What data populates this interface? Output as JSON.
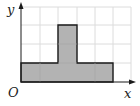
{
  "diagram": {
    "type": "region-on-grid",
    "axes": {
      "x_label": "x",
      "y_label": "y",
      "origin_label": "O"
    },
    "grid": {
      "columns": 6,
      "rows": 4,
      "line_color": "#dcdcdc"
    },
    "shape": {
      "description": "inverted T-shaped shaded region",
      "fill": "#b3b3b3",
      "stroke": "#1a1a1a",
      "base_rect": {
        "x0": 0,
        "x1": 5,
        "y0": 0,
        "y1": 1
      },
      "top_rect": {
        "x0": 2,
        "x1": 3,
        "y0": 1,
        "y1": 3
      }
    }
  }
}
